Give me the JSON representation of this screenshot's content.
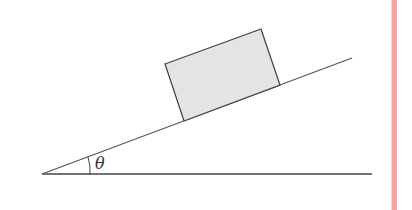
{
  "diagram": {
    "type": "inclined-plane",
    "angle_label": "θ",
    "colors": {
      "line": "#444444",
      "block_fill": "#e4e4e4",
      "margin_line": "#f2a5a5"
    },
    "elements": [
      "ground",
      "incline",
      "block",
      "angle-arc",
      "angle-label"
    ]
  }
}
